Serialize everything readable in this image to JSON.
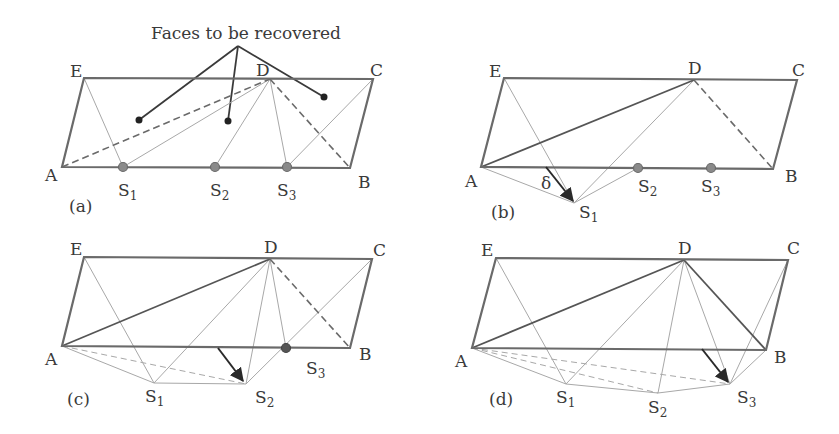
{
  "figure": {
    "annotation": "Faces to be recovered",
    "panels": [
      {
        "id": "a",
        "label": "(a)",
        "vertices": {
          "A": "A",
          "B": "B",
          "C": "C",
          "D": "D",
          "E": "E"
        },
        "steiner": [
          {
            "base": "S",
            "sub": "1"
          },
          {
            "base": "S",
            "sub": "2"
          },
          {
            "base": "S",
            "sub": "3"
          }
        ]
      },
      {
        "id": "b",
        "label": "(b)",
        "vertices": {
          "A": "A",
          "B": "B",
          "C": "C",
          "D": "D",
          "E": "E"
        },
        "steiner": [
          {
            "base": "S",
            "sub": "1"
          },
          {
            "base": "S",
            "sub": "2"
          },
          {
            "base": "S",
            "sub": "3"
          }
        ],
        "displacement": "δ"
      },
      {
        "id": "c",
        "label": "(c)",
        "vertices": {
          "A": "A",
          "B": "B",
          "C": "C",
          "D": "D",
          "E": "E"
        },
        "steiner": [
          {
            "base": "S",
            "sub": "1"
          },
          {
            "base": "S",
            "sub": "2"
          },
          {
            "base": "S",
            "sub": "3"
          }
        ]
      },
      {
        "id": "d",
        "label": "(d)",
        "vertices": {
          "A": "A",
          "B": "B",
          "C": "C",
          "D": "D",
          "E": "E"
        },
        "steiner": [
          {
            "base": "S",
            "sub": "1"
          },
          {
            "base": "S",
            "sub": "2"
          },
          {
            "base": "S",
            "sub": "3"
          }
        ]
      }
    ]
  }
}
